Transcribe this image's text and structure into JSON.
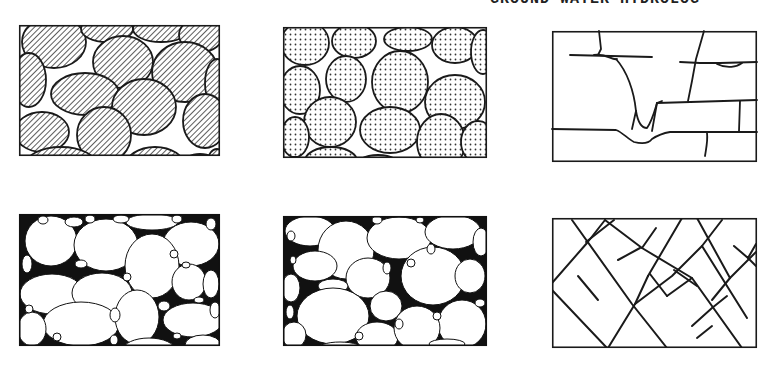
{
  "running_head": "GROUND WATER HYDROLOG",
  "colors": {
    "ink": "#1a1a1a",
    "paper": "#ffffff",
    "hatch_fill": "#9a9a9a"
  },
  "panels": [
    {
      "id": "a",
      "label": "Well-sorted sedimentary deposit with porous (hatched) grains",
      "fill": "hatched",
      "position": {
        "x": 19,
        "y": 25,
        "w": 201,
        "h": 131
      }
    },
    {
      "id": "b",
      "label": "Well-sorted sedimentary deposit of porous (stippled) pebbles",
      "fill": "stippled",
      "position": {
        "x": 283,
        "y": 27,
        "w": 204,
        "h": 131
      }
    },
    {
      "id": "c",
      "label": "Rock rendered porous by solution along joints",
      "fill": "open-fractures",
      "position": {
        "x": 552,
        "y": 31,
        "w": 205,
        "h": 131
      }
    },
    {
      "id": "d",
      "label": "Poorly sorted sedimentary deposit",
      "fill": "white-grains-black-matrix-with-small-voids",
      "position": {
        "x": 19,
        "y": 214,
        "w": 201,
        "h": 132
      }
    },
    {
      "id": "e",
      "label": "Well-sorted deposit with interstices filled by mineral matter",
      "fill": "white-grains-black-matrix",
      "position": {
        "x": 283,
        "y": 216,
        "w": 204,
        "h": 130
      }
    },
    {
      "id": "f",
      "label": "Rock rendered porous by fracturing",
      "fill": "diagonal-fractures",
      "position": {
        "x": 552,
        "y": 218,
        "w": 205,
        "h": 130
      }
    }
  ]
}
